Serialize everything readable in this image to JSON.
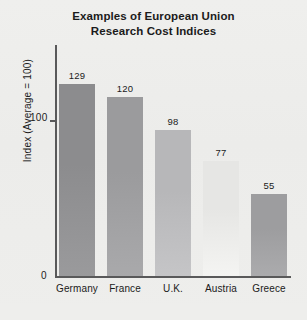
{
  "chart_data": {
    "type": "bar",
    "title": "Examples of European Union Research Cost Indices",
    "title_line1": "Examples of European Union",
    "title_line2": "Research Cost Indices",
    "categories": [
      "Germany",
      "France",
      "U.K.",
      "Austria",
      "Greece"
    ],
    "values": [
      129,
      120,
      98,
      77,
      55
    ],
    "value_labels": [
      "129",
      "120",
      "98",
      "77",
      "55"
    ],
    "xlabel": "",
    "ylabel": "Index (Average = 100)",
    "ylim": [
      0,
      155
    ],
    "ytick_values": [
      0,
      100
    ],
    "ytick_labels": [
      "0",
      "100"
    ],
    "grid": false,
    "legend": false,
    "bar_colors": [
      "#8c8c8e",
      "#9b9b9d",
      "#b7b7b9",
      "#e6e6e4",
      "#9d9d9f"
    ]
  },
  "axis": {
    "y_title": "Index (Average = 100)",
    "tick_100": "100",
    "tick_0": "0"
  }
}
